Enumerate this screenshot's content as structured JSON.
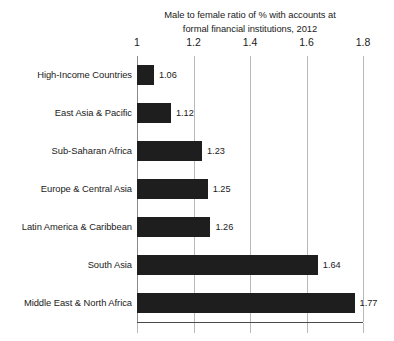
{
  "chart_data": {
    "type": "bar",
    "orientation": "horizontal",
    "title": "Male to female ratio of % with accounts at formal financial institutions, 2012",
    "title_lines": [
      "Male to female ratio of % with accounts at",
      "formal financial institutions, 2012"
    ],
    "xlabel": "",
    "ylabel": "",
    "categories": [
      "High-Income Countries",
      "East Asia & Pacific",
      "Sub-Saharan Africa",
      "Europe & Central Asia",
      "Latin America & Caribbean",
      "South Asia",
      "Middle East & North Africa"
    ],
    "values": [
      1.06,
      1.12,
      1.23,
      1.25,
      1.26,
      1.64,
      1.77
    ],
    "value_labels": [
      "1.06",
      "1.12",
      "1.23",
      "1.25",
      "1.26",
      "1.64",
      "1.77"
    ],
    "xlim": [
      1,
      1.8
    ],
    "xticks": [
      1,
      1.2,
      1.4,
      1.6,
      1.8
    ],
    "xtick_labels": [
      "1",
      "1.2",
      "1.4",
      "1.6",
      "1.8"
    ],
    "grid": "vertical",
    "legend": null,
    "bar_color": "#1e1e1e",
    "gridline_color": "#b9b9b9",
    "axis_color": "#4a4a4a",
    "background_color": "#ffffff",
    "text_color": "#1a1a1a"
  }
}
